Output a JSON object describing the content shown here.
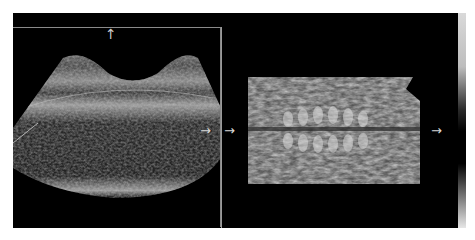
{
  "image": {
    "description": "Ultrasound scan: left 2D sector view of fetal spine with frame, right rendered 3D volume of spine",
    "background": "#ffffff",
    "panel_color": "#000000",
    "frame_color": "#8a8a8a",
    "arrow_color": "#d8d8d8"
  },
  "markers": {
    "up_arrow": "↑",
    "right_arrow_left_panel": "→",
    "right_arrow_divider": "→",
    "right_arrow_volume": "→"
  }
}
